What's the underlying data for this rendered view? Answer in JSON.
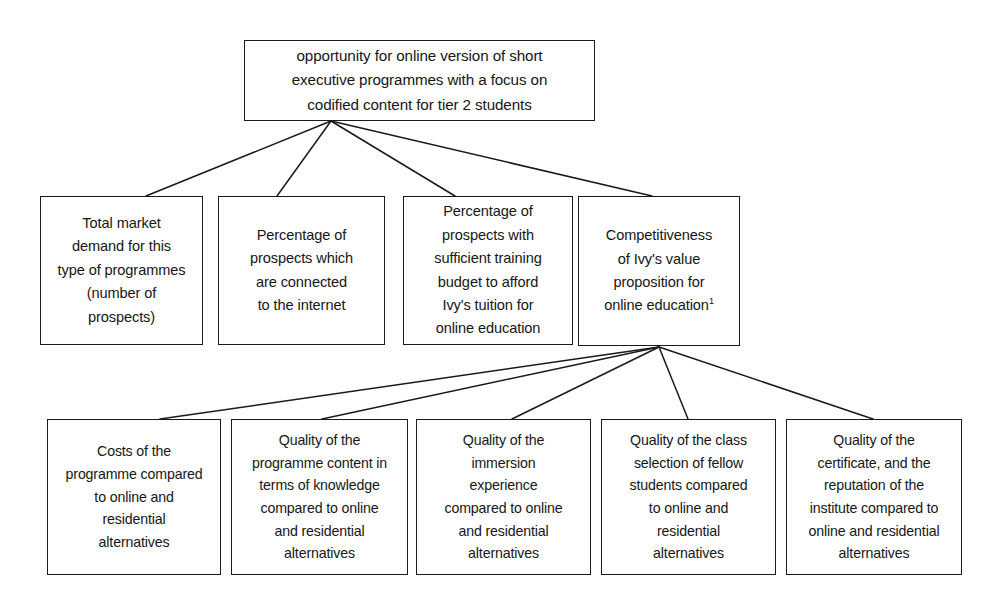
{
  "diagram": {
    "type": "issue-tree",
    "title_text": "opportunity for online version of short executive programmes with a focus on codified content for tier 2 students",
    "root": {
      "id": "root",
      "label": "opportunity for online version of short\nexecutive programmes with a focus on\ncodified content for tier 2 students"
    },
    "level2": [
      {
        "id": "l2-total-market-demand",
        "label": "Total market\ndemand for this\ntype of programmes\n(number of\nprospects)"
      },
      {
        "id": "l2-prospects-connected-internet",
        "label": "Percentage of\nprospects which\nare connected\nto the internet"
      },
      {
        "id": "l2-prospects-training-budget",
        "label": "Percentage of\nprospects with\nsufficient training\nbudget to afford\nIvy's tuition for\nonline education"
      },
      {
        "id": "l2-competitiveness-value-proposition",
        "label": "Competitiveness\nof Ivy's value\nproposition for\nonline education",
        "footnote_marker": "1"
      }
    ],
    "level3": [
      {
        "id": "l3-costs-of-programme",
        "label": "Costs of the\nprogramme compared\nto online and\nresidential\nalternatives"
      },
      {
        "id": "l3-quality-programme-content",
        "label": "Quality of the\nprogramme content in\nterms of knowledge\ncompared to online\nand residential\nalternatives"
      },
      {
        "id": "l3-quality-immersion-experience",
        "label": "Quality of the\nimmersion\nexperience\ncompared to online\nand residential\nalternatives"
      },
      {
        "id": "l3-quality-class-selection",
        "label": "Quality of the class\nselection of fellow\nstudents compared\nto online and\nresidential\nalternatives"
      },
      {
        "id": "l3-quality-certificate-reputation",
        "label": "Quality of the\ncertificate, and the\nreputation of the\ninstitute compared to\nonline and residential\nalternatives"
      }
    ],
    "colors": {
      "border": "#1a1a1a",
      "text": "#161616",
      "background": "#ffffff",
      "edge": "#1a1a1a"
    }
  }
}
